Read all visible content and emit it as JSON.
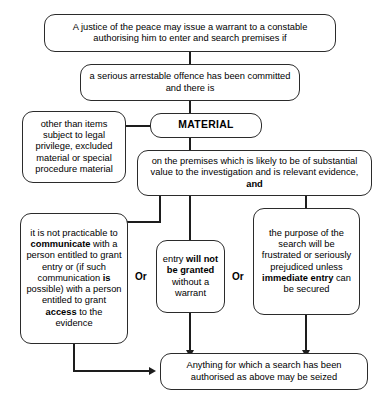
{
  "diagram": {
    "nodes": {
      "n1": {
        "text": "A justice of the peace may issue a warrant to a constable authorising him to enter and search premises if"
      },
      "n2": {
        "text": "a serious arrestable offence has been committed and there is"
      },
      "material": {
        "text": "MATERIAL"
      },
      "exclusion": {
        "text": "other than items subject to legal privilege, excluded material or special procedure material"
      },
      "premises": {
        "pre": "on the premises which is likely to be of substantial value to the investigation and is relevant evidence,",
        "bold": "and"
      },
      "branch_left": {
        "p1": "it is not practicable to ",
        "b1": "communicate",
        "p2": " with a person entitled to grant entry or (if such communication ",
        "b2": "is",
        "p3": " possible) with a person entitled to grant ",
        "b3": "access",
        "p4": " to the evidence"
      },
      "branch_mid": {
        "p1": "entry ",
        "b1": "will not be granted",
        "p2": " without a warrant"
      },
      "branch_right": {
        "p1": "the purpose of the search will be frustrated or seriously prejudiced unless ",
        "b1": "immediate entry",
        "p2": " can be secured"
      },
      "result": {
        "text": "Anything for which a search has been authorised as above may be seized"
      }
    },
    "connectors": {
      "or_left_label": "Or",
      "or_right_label": "Or"
    },
    "colors": {
      "stroke": "#2b2b2b",
      "line": "#1d1d1d",
      "background": "#ffffff",
      "text": "#000000"
    }
  }
}
